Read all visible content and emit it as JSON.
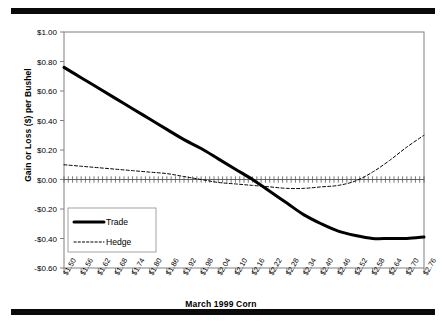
{
  "figure": {
    "ylabel": "Gain or Loss ($) per Bushel",
    "xlabel": "March 1999 Corn",
    "legend": {
      "trade": "Trade",
      "hedge": "Hedge"
    },
    "colors": {
      "line": "#000000",
      "rule": "#0a0a0a",
      "axis": "#808080",
      "border": "#808080"
    }
  },
  "chart_data": {
    "type": "line",
    "title": "",
    "xlabel": "March 1999 Corn",
    "ylabel": "Gain or Loss ($) per Bushel",
    "grid": false,
    "legend_position": "inside-lower-left",
    "ylim": [
      -0.6,
      1.0
    ],
    "ytick_labels": [
      "$1.00",
      "$0.80",
      "$0.60",
      "$0.40",
      "$0.20",
      "$0.00",
      "-$0.20",
      "-$0.40",
      "-$0.60"
    ],
    "ytick_values": [
      1.0,
      0.8,
      0.6,
      0.4,
      0.2,
      0.0,
      -0.2,
      -0.4,
      -0.6
    ],
    "categories": [
      "$1.50",
      "$1.56",
      "$1.62",
      "$1.68",
      "$1.74",
      "$1.80",
      "$1.86",
      "$1.92",
      "$1.98",
      "$2.04",
      "$2.10",
      "$2.16",
      "$2.22",
      "$2.28",
      "$2.34",
      "$2.40",
      "$2.46",
      "$2.52",
      "$2.58",
      "$2.64",
      "$2.70",
      "$2.76"
    ],
    "x": [
      1.5,
      1.56,
      1.62,
      1.68,
      1.74,
      1.8,
      1.86,
      1.92,
      1.98,
      2.04,
      2.1,
      2.16,
      2.22,
      2.28,
      2.34,
      2.4,
      2.46,
      2.52,
      2.58,
      2.64,
      2.7,
      2.76
    ],
    "series": [
      {
        "name": "Trade",
        "style": "solid",
        "width": 3.0,
        "values": [
          0.76,
          0.69,
          0.62,
          0.55,
          0.48,
          0.41,
          0.34,
          0.27,
          0.21,
          0.14,
          0.07,
          0.0,
          -0.08,
          -0.16,
          -0.24,
          -0.3,
          -0.35,
          -0.38,
          -0.4,
          -0.4,
          -0.4,
          -0.39
        ]
      },
      {
        "name": "Hedge",
        "style": "dotted",
        "width": 1.0,
        "values": [
          0.1,
          0.09,
          0.08,
          0.07,
          0.06,
          0.05,
          0.04,
          0.02,
          0.0,
          -0.02,
          -0.03,
          -0.04,
          -0.05,
          -0.06,
          -0.06,
          -0.05,
          -0.04,
          -0.01,
          0.05,
          0.13,
          0.22,
          0.3
        ]
      }
    ],
    "zero_line": {
      "value": 0.0,
      "markers": "tick"
    }
  }
}
